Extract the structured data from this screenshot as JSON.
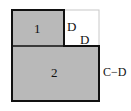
{
  "diagram": {
    "type": "area-decomposition",
    "colors": {
      "fill": "#b9b9b9",
      "stroke": "#111111",
      "notch_border": "#c8c8c8",
      "background": "#ffffff"
    },
    "regions": [
      {
        "id": "1",
        "label": "1"
      },
      {
        "id": "2",
        "label": "2"
      }
    ],
    "dimensions": {
      "notch_height_label": "D",
      "notch_width_label": "D",
      "region2_right_side_label": "C−D"
    }
  }
}
